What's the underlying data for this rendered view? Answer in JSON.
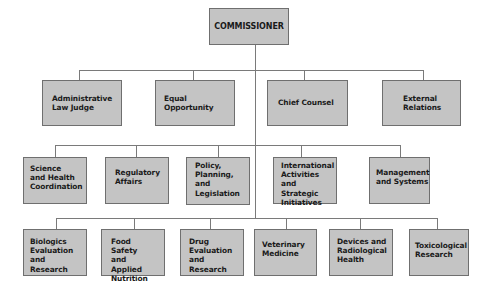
{
  "chart_title": "",
  "root": {
    "label": "COMMISSIONER"
  },
  "row1": [
    {
      "label": "Administrative\nLaw Judge"
    },
    {
      "label": "Equal\nOpportunity"
    },
    {
      "label": "Chief Counsel"
    },
    {
      "label": "External\nRelations"
    }
  ],
  "row2": [
    {
      "label": "Science\nand Health\nCoordination"
    },
    {
      "label": "Regulatory\nAffairs"
    },
    {
      "label": "Policy,\nPlanning,\nand\nLegislation"
    },
    {
      "label": "International\nActivities and\nStrategic\nInitiatives"
    },
    {
      "label": "Management\nand Systems"
    }
  ],
  "row3": [
    {
      "label": "Biologics\nEvaluation and\nResearch"
    },
    {
      "label": "Food Safety\nand Applied\nNutrition"
    },
    {
      "label": "Drug\nEvaluation\nand Research"
    },
    {
      "label": "Veterinary\nMedicine"
    },
    {
      "label": "Devices and\nRadiological\nHealth"
    },
    {
      "label": "Toxicological\nResearch"
    }
  ],
  "colors": {
    "box_fill": "#c4c4c4",
    "box_border": "#6f6f6f",
    "connector": "#7a7a7a",
    "text": "#1a1a1a"
  }
}
